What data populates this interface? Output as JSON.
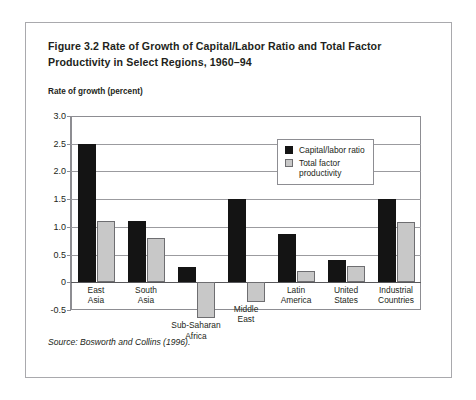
{
  "figure": {
    "title": "Figure 3.2 Rate of Growth of Capital/Labor Ratio and Total Factor Productivity in Select Regions, 1960–94",
    "axis_caption": "Rate of growth\n(percent)",
    "source": "Source: Bosworth and Collins (1996)."
  },
  "legend": {
    "position": "top-right-inside",
    "entries": [
      {
        "label": "Capital/labor ratio",
        "color": "#141414",
        "swatch": "dark"
      },
      {
        "label": "Total factor\nproductivity",
        "color": "#c8c8c8",
        "swatch": "light"
      }
    ]
  },
  "chart_data": {
    "type": "bar",
    "title": "Figure 3.2 Rate of Growth of Capital/Labor Ratio and Total Factor Productivity in Select Regions, 1960–94",
    "xlabel": "",
    "ylabel": "Rate of growth (percent)",
    "ylim": [
      -0.5,
      3.0
    ],
    "ytick_values": [
      3.0,
      2.5,
      2.0,
      1.5,
      1.0,
      0.5,
      0,
      -0.5
    ],
    "ytick_labels": [
      "3.0",
      "2.5",
      "2.0",
      "1.5",
      "1.0",
      "0.5",
      "0",
      "-0.5"
    ],
    "grid": true,
    "zero_line": 0,
    "categories": [
      "East\nAsia",
      "South\nAsia",
      "Sub-Saharan\nAfrica",
      "Middle\nEast",
      "Latin\nAmerica",
      "United\nStates",
      "Industrial\nCountries"
    ],
    "series": [
      {
        "name": "Capital/labor ratio",
        "color": "#141414",
        "values": [
          2.5,
          1.1,
          0.28,
          1.5,
          0.88,
          0.4,
          1.5
        ]
      },
      {
        "name": "Total factor productivity",
        "color": "#c8c8c8",
        "values": [
          1.1,
          0.8,
          -0.65,
          -0.35,
          0.2,
          0.3,
          1.08
        ]
      }
    ]
  }
}
